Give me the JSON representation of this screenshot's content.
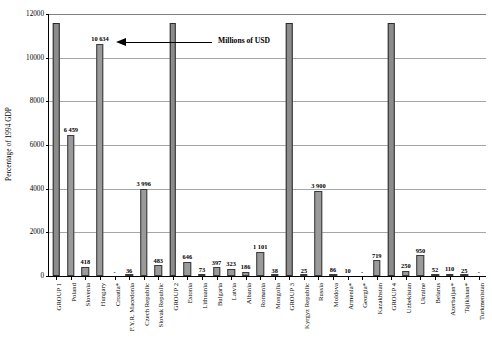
{
  "chart_data": {
    "type": "bar",
    "title": "",
    "subtitle": "",
    "xlabel": "",
    "ylabel": "Percentage of 1994 GDP",
    "ylim": [
      0,
      12000
    ],
    "ytick_step": 2000,
    "ytick_labels": [
      "0",
      "2000",
      "4000",
      "6000",
      "8000",
      "10000",
      "12000"
    ],
    "grid": true,
    "legend": "none",
    "annotation": {
      "text": "Millions of USD",
      "target": "Hungary bar value label",
      "arrow": "left-pointing"
    },
    "categories": [
      "GROUP 1",
      "Poland",
      "Slovenia",
      "Hungary",
      "Croatia*",
      "F.Y.R. Macedonia",
      "Czech Republic",
      "Slovak Republic",
      "GROUP 2",
      "Estonia",
      "Lithuania",
      "Bulgaria",
      "Latvia",
      "Albania",
      "Romania",
      "Mongolia",
      "GROUP 3",
      "Kyrgyz Republic",
      "Russia",
      "Moldova",
      "Armenia*",
      "Georgia*",
      "Kazakhstan",
      "GROUP 4",
      "Uzbekistan",
      "Ukraine",
      "Belarus",
      "Azerbaijan*",
      "Tajikistan*",
      "Turkmenistan"
    ],
    "values": [
      11600,
      6459,
      418,
      10634,
      0,
      36,
      3996,
      483,
      11600,
      646,
      73,
      397,
      323,
      186,
      1101,
      38,
      11600,
      25,
      3900,
      86,
      10,
      0,
      719,
      11600,
      250,
      950,
      52,
      110,
      25,
      0
    ],
    "data_labels": [
      "",
      "6 459",
      "418",
      "10 634",
      "-",
      "36",
      "3 996",
      "483",
      "",
      "646",
      "73",
      "397",
      "323",
      "186",
      "1 101",
      "38",
      "",
      "25",
      "3 900",
      "86",
      "10",
      "-",
      "719",
      "",
      "250",
      "950",
      "52",
      "110",
      "25",
      "-"
    ],
    "is_group_bar": [
      true,
      false,
      false,
      false,
      false,
      false,
      false,
      false,
      true,
      false,
      false,
      false,
      false,
      false,
      false,
      false,
      true,
      false,
      false,
      false,
      false,
      false,
      false,
      true,
      false,
      false,
      false,
      false,
      false,
      false
    ],
    "colors": {
      "bar_fill": "#9a9a9a",
      "bar_stroke": "#3a3a3a",
      "group_bar_fill": "#8c8c8c",
      "gridline": "#a6a6a6",
      "axis": "#000000",
      "text": "#000000"
    }
  }
}
